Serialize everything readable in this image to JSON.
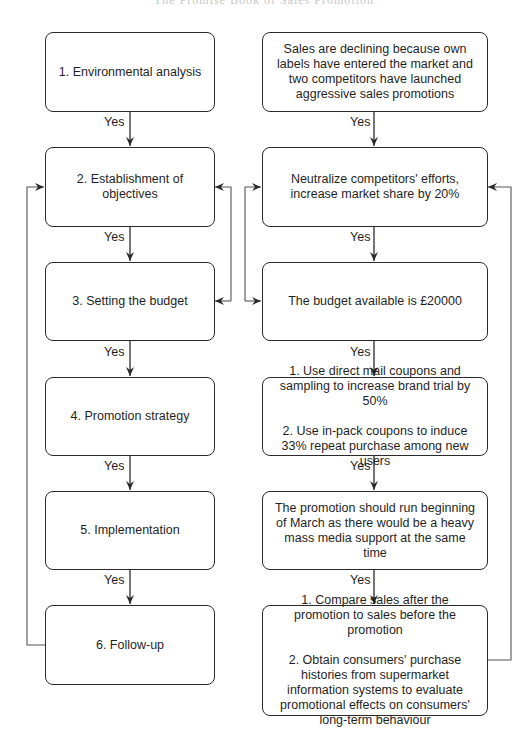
{
  "header": {
    "title": "The Promise Book of Sales Promotion"
  },
  "diagram": {
    "edge_label": "Yes",
    "left_column": [
      {
        "id": "L1",
        "label": "1. Environmental analysis"
      },
      {
        "id": "L2",
        "label": "2. Establishment of objectives"
      },
      {
        "id": "L3",
        "label": "3. Setting the budget"
      },
      {
        "id": "L4",
        "label": "4. Promotion strategy"
      },
      {
        "id": "L5",
        "label": "5. Implementation"
      },
      {
        "id": "L6",
        "label": "6. Follow-up"
      }
    ],
    "right_column": [
      {
        "id": "R1",
        "label": "Sales are declining because own labels have entered the market and two competitors have launched aggressive sales promotions"
      },
      {
        "id": "R2",
        "label": "Neutralize competitors' efforts, increase market share by 20%"
      },
      {
        "id": "R3",
        "label": "The budget available is £20000"
      },
      {
        "id": "R4",
        "items": [
          "1. Use direct mail coupons and sampling to increase brand trial by 50%",
          "2. Use in-pack coupons to induce 33% repeat purchase among new users"
        ]
      },
      {
        "id": "R5",
        "label": "The promotion should run beginning of March as there would be a heavy mass media support at the same time"
      },
      {
        "id": "R6",
        "items": [
          "1. Compare sales after the promotion to sales before the promotion",
          "2. Obtain consumers' purchase histories from supermarket information systems to evaluate promotional effects on consumers' long-term behaviour"
        ]
      }
    ],
    "edges": [
      {
        "from": "L1",
        "to": "L2",
        "label": "Yes"
      },
      {
        "from": "L2",
        "to": "L3",
        "label": "Yes"
      },
      {
        "from": "L3",
        "to": "L4",
        "label": "Yes"
      },
      {
        "from": "L4",
        "to": "L5",
        "label": "Yes"
      },
      {
        "from": "L5",
        "to": "L6",
        "label": "Yes"
      },
      {
        "from": "L6",
        "to": "L2",
        "label": ""
      },
      {
        "from": "L3",
        "to": "L2",
        "label": ""
      },
      {
        "from": "R1",
        "to": "R2",
        "label": "Yes"
      },
      {
        "from": "R2",
        "to": "R3",
        "label": "Yes"
      },
      {
        "from": "R3",
        "to": "R4",
        "label": "Yes"
      },
      {
        "from": "R4",
        "to": "R5",
        "label": "Yes"
      },
      {
        "from": "R5",
        "to": "R6",
        "label": "Yes"
      },
      {
        "from": "R6",
        "to": "R2",
        "label": ""
      },
      {
        "from": "R2",
        "to": "R3",
        "label": ""
      }
    ]
  }
}
